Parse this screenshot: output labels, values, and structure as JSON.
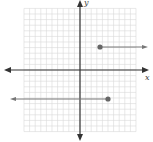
{
  "chart_data": {
    "type": "line",
    "title": "",
    "xlabel": "x",
    "ylabel": "y",
    "grid": true,
    "grid_range": {
      "x": [
        -10,
        10
      ],
      "y": [
        -11,
        11
      ]
    },
    "series": [
      {
        "name": "upper ray",
        "start": {
          "x": 4,
          "y": 4,
          "closed": true
        },
        "direction": "right",
        "y": 4
      },
      {
        "name": "lower ray",
        "start": {
          "x": 5,
          "y": -5,
          "closed": true
        },
        "direction": "left",
        "y": -5
      }
    ]
  },
  "labels": {
    "x_axis": "x",
    "y_axis": "y"
  },
  "colors": {
    "grid": "#d8d8d8",
    "axis": "#333333",
    "ray": "#777777",
    "point": "#666666"
  }
}
